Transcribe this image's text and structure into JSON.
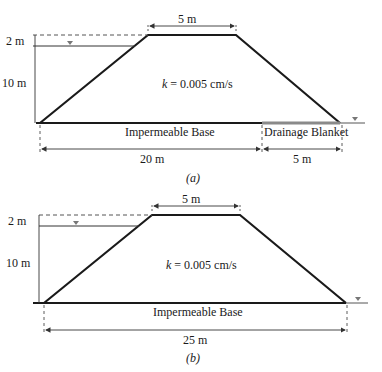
{
  "figure_a": {
    "caption": "(a)",
    "crest_width": "5 m",
    "freeboard": "2 m",
    "water_depth": "10 m",
    "permeability_symbol": "k",
    "permeability_value": "= 0.005 cm/s",
    "base_label": "Impermeable Base",
    "drain_label": "Drainage Blanket",
    "base_length": "20 m",
    "drain_length": "5 m"
  },
  "figure_b": {
    "caption": "(b)",
    "crest_width": "5 m",
    "freeboard": "2 m",
    "water_depth": "10 m",
    "permeability_symbol": "k",
    "permeability_value": "= 0.005 cm/s",
    "base_label": "Impermeable Base",
    "base_length": "25 m"
  },
  "colors": {
    "line": "#1a1a1a",
    "dim": "#333333",
    "drain": "#8a8a8a",
    "water_symbol": "#777777"
  }
}
